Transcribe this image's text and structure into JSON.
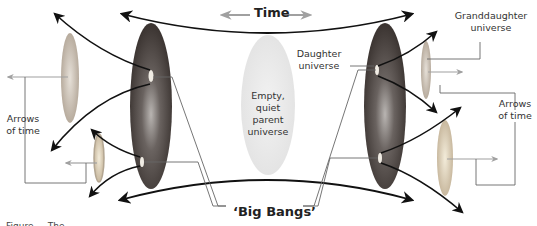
{
  "diagram": {
    "title_label": "Time",
    "labels": {
      "parent": "Empty, quiet parent universe",
      "parent_lines": [
        "Empty, quiet",
        "parent",
        "universe"
      ],
      "daughter": [
        "Daughter",
        "universe"
      ],
      "granddaughter": [
        "Granddaughter",
        "universe"
      ],
      "arrows_left": [
        "Arrows",
        "of time"
      ],
      "arrows_right": [
        "Arrows",
        "of time"
      ],
      "big_bangs": "‘Big Bangs’"
    },
    "caption_fragment": "Figure ... The ... "
  },
  "colors": {
    "arrow_dark": "#1a1a1a",
    "arrow_grey": "#9a9a9a",
    "leader_line": "#666666",
    "parent_fill": "#ececec",
    "daughter_fill": "#4a4440",
    "grand_fill": "#c9c0b5"
  }
}
